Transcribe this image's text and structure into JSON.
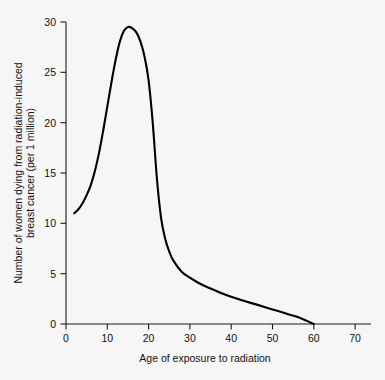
{
  "chart_data": {
    "type": "line",
    "title": "",
    "xlabel": "Age of exposure to radiation",
    "ylabel_line1": "Number of women dying from radiation-induced",
    "ylabel_line2": "breast cancer (per 1 million)",
    "ylabel": "Number of women dying from radiation-induced breast cancer (per 1 million)",
    "xlim": [
      0,
      75
    ],
    "ylim": [
      0,
      30
    ],
    "xticks": [
      0,
      10,
      20,
      30,
      40,
      50,
      60,
      70
    ],
    "yticks": [
      0,
      5,
      10,
      15,
      20,
      25,
      30
    ],
    "xticklabels": [
      "0",
      "10",
      "20",
      "30",
      "40",
      "50",
      "60",
      "70"
    ],
    "yticklabels": [
      "0",
      "5",
      "10",
      "15",
      "20",
      "25",
      "30"
    ],
    "grid": false,
    "legend": null,
    "series": [
      {
        "name": "Radiation-induced breast cancer deaths",
        "x": [
          2,
          3,
          4,
          5,
          6,
          7,
          8,
          9,
          10,
          11,
          12,
          13,
          14,
          15,
          16,
          17,
          18,
          19,
          20,
          21,
          22,
          23,
          24,
          25,
          26,
          28,
          30,
          32,
          34,
          36,
          38,
          40,
          43,
          46,
          50,
          54,
          57,
          60
        ],
        "y": [
          11.0,
          11.4,
          12.0,
          12.8,
          13.8,
          15.2,
          17.0,
          19.2,
          21.6,
          24.0,
          26.2,
          28.0,
          29.1,
          29.5,
          29.4,
          29.0,
          28.1,
          26.6,
          24.2,
          20.0,
          14.5,
          10.6,
          8.5,
          7.2,
          6.3,
          5.2,
          4.6,
          4.1,
          3.7,
          3.35,
          3.0,
          2.7,
          2.3,
          1.95,
          1.45,
          0.95,
          0.55,
          0.0
        ]
      }
    ]
  },
  "axes": {
    "x_axis_name": "x-axis",
    "y_axis_name": "y-axis"
  }
}
